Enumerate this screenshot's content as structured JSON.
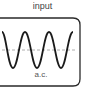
{
  "diagram": {
    "title": "input",
    "label": "a.c.",
    "colors": {
      "wave": "#1a1a1a",
      "border": "#2a2a2a",
      "midline": "#999999"
    }
  }
}
